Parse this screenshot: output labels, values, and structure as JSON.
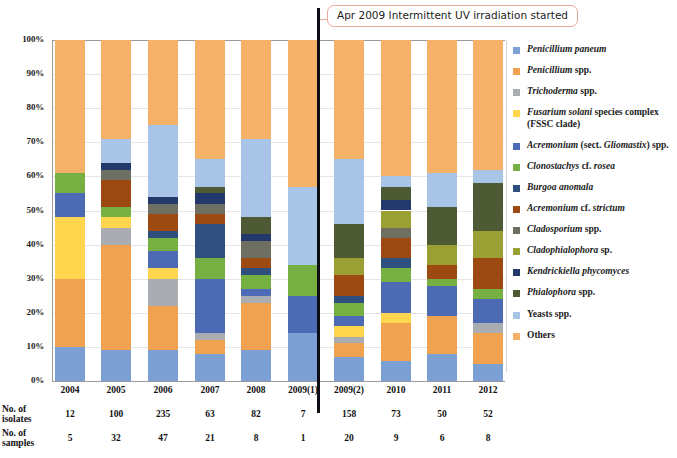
{
  "chart_data": {
    "type": "bar",
    "subtype": "100% stacked column",
    "title": "",
    "xlabel": "",
    "ylabel": "",
    "ylim": [
      0,
      100
    ],
    "ytick_labels": [
      "100%",
      "90%",
      "80%",
      "70%",
      "60%",
      "50%",
      "40%",
      "30%",
      "20%",
      "10%",
      "0%"
    ],
    "ytick_values": [
      100,
      90,
      80,
      70,
      60,
      50,
      40,
      30,
      20,
      10,
      0
    ],
    "grid": true,
    "legend_position": "right",
    "categories": [
      "2004",
      "2005",
      "2006",
      "2007",
      "2008",
      "2009(1)",
      "2009(2)",
      "2010",
      "2011",
      "2012"
    ],
    "series": [
      {
        "name": "Penicillium paneum",
        "color": "#7c9fd4",
        "values": [
          10.0,
          9.0,
          9.0,
          8.0,
          9.0,
          14.0,
          7.0,
          6.0,
          8.0,
          5.0
        ]
      },
      {
        "name": "Penicillium spp.",
        "color": "#f0a250",
        "values": [
          20.0,
          31.0,
          13.0,
          4.0,
          14.0,
          0.0,
          4.0,
          11.0,
          11.0,
          9.0
        ]
      },
      {
        "name": "Trichoderma spp.",
        "color": "#a9adb2",
        "values": [
          0.0,
          5.0,
          8.0,
          2.0,
          2.0,
          0.0,
          2.0,
          0.0,
          0.0,
          3.0
        ]
      },
      {
        "name": "Fusarium solani species complex (FSSC clade)",
        "color": "#ffd64d",
        "values": [
          18.0,
          3.0,
          3.0,
          0.0,
          0.0,
          0.0,
          3.0,
          3.0,
          0.0,
          0.0
        ]
      },
      {
        "name": "Acremonium (sect. Gliomastix) spp.",
        "color": "#4d6bb5",
        "values": [
          7.0,
          0.0,
          5.0,
          16.0,
          2.0,
          11.0,
          3.0,
          9.0,
          9.0,
          7.0
        ]
      },
      {
        "name": "Clonostachys cf. rosea",
        "color": "#76b043",
        "values": [
          6.0,
          3.0,
          4.0,
          6.0,
          4.0,
          9.0,
          4.0,
          4.0,
          2.0,
          3.0
        ]
      },
      {
        "name": "Burgoa anomala",
        "color": "#2f4f7f",
        "values": [
          0.0,
          0.0,
          2.0,
          10.0,
          2.0,
          0.0,
          2.0,
          3.0,
          0.0,
          0.0
        ]
      },
      {
        "name": "Acremonium cf. strictum",
        "color": "#9c4a12",
        "values": [
          0.0,
          8.0,
          5.0,
          3.0,
          3.0,
          0.0,
          6.0,
          6.0,
          4.0,
          9.0
        ]
      },
      {
        "name": "Cladosporium spp.",
        "color": "#6e6f62",
        "values": [
          0.0,
          3.0,
          3.0,
          3.0,
          5.0,
          0.0,
          0.0,
          3.0,
          0.0,
          0.0
        ]
      },
      {
        "name": "Cladophialophora sp.",
        "color": "#9aa033",
        "values": [
          0.0,
          0.0,
          0.0,
          0.0,
          0.0,
          0.0,
          5.0,
          5.0,
          6.0,
          8.0
        ]
      },
      {
        "name": "Kendrickiella phycomyces",
        "color": "#23386b",
        "values": [
          0.0,
          2.0,
          2.0,
          3.0,
          2.0,
          0.0,
          0.0,
          3.0,
          0.0,
          0.0
        ]
      },
      {
        "name": "Phialophora spp.",
        "color": "#4d5a33",
        "values": [
          0.0,
          0.0,
          0.0,
          2.0,
          5.0,
          0.0,
          10.0,
          4.0,
          11.0,
          14.0
        ]
      },
      {
        "name": "Yeasts spp.",
        "color": "#a8c5e8",
        "values": [
          0.0,
          7.0,
          21.0,
          8.0,
          23.0,
          23.0,
          19.0,
          3.0,
          10.0,
          4.0
        ]
      },
      {
        "name": "Others",
        "color": "#f5b168",
        "values": [
          39.0,
          29.0,
          25.0,
          35.0,
          29.0,
          43.0,
          35.0,
          40.0,
          39.0,
          38.0
        ]
      }
    ],
    "annotations": [
      {
        "text": "Apr 2009 Intermittent UV irradiation started",
        "x_between": [
          "2009(1)",
          "2009(2)"
        ]
      }
    ],
    "table": {
      "rows": [
        {
          "label": "No. of isolates",
          "label_line1": "No. of",
          "label_line2": "isolates",
          "values": [
            "12",
            "100",
            "235",
            "63",
            "82",
            "7",
            "158",
            "73",
            "50",
            "52"
          ]
        },
        {
          "label": "No. of samples",
          "label_line1": "No. of",
          "label_line2": "samples",
          "values": [
            "5",
            "32",
            "47",
            "21",
            "8",
            "1",
            "20",
            "9",
            "6",
            "8"
          ]
        }
      ]
    }
  },
  "legend": {
    "items": [
      {
        "color": "#7c9fd4",
        "html": "<i>Penicillium paneum</i>"
      },
      {
        "color": "#f0a250",
        "html": "<i>Penicillium</i> spp."
      },
      {
        "color": "#a9adb2",
        "html": "<i>Trichoderma</i> spp."
      },
      {
        "color": "#ffd64d",
        "html": "<i>Fusarium solani</i> species complex<br>(FSSC clade)"
      },
      {
        "color": "#4d6bb5",
        "html": "<i>Acremonium</i> (sect. <i>Gliomastix</i>) spp."
      },
      {
        "color": "#76b043",
        "html": "<i>Clonostachys</i> cf. <i>rosea</i>"
      },
      {
        "color": "#2f4f7f",
        "html": "<i>Burgoa anomala</i>"
      },
      {
        "color": "#9c4a12",
        "html": "<i>Acremonium</i> cf. <i>strictum</i>"
      },
      {
        "color": "#6e6f62",
        "html": "<i>Cladosporium</i> spp."
      },
      {
        "color": "#9aa033",
        "html": "<i>Cladophialophora</i> sp."
      },
      {
        "color": "#23386b",
        "html": "<i>Kendrickiella phycomyces</i>"
      },
      {
        "color": "#4d5a33",
        "html": "<i>Phialophora</i> spp."
      },
      {
        "color": "#a8c5e8",
        "html": "Yeasts spp."
      },
      {
        "color": "#f5b168",
        "html": "Others"
      }
    ]
  },
  "uv_annotation": {
    "text": "Apr 2009 Intermittent UV irradiation started",
    "border_color": "#e8a99b",
    "divider_color": "#0d0d14"
  }
}
